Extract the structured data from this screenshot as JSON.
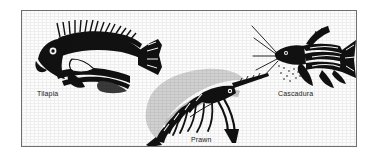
{
  "figure": {
    "background_color": "#fdfdfd",
    "border_color": "#6e6e6e",
    "ink_color": "#111111",
    "specimens": [
      {
        "id": "tilapia",
        "label": "Tilapia",
        "icon": "tilapia-fish-illustration",
        "description": "Side view line engraving of a tilapia fish facing left with spiny dorsal fin"
      },
      {
        "id": "prawn",
        "label": "Prawn",
        "icon": "prawn-illustration",
        "description": "Side view line engraving of a freshwater prawn facing right with long rostrum and walking legs"
      },
      {
        "id": "cascadura",
        "label": "Cascadura",
        "icon": "cascadura-catfish-illustration",
        "description": "Side view line engraving of a cascadura armoured catfish facing left with barbels"
      }
    ]
  }
}
